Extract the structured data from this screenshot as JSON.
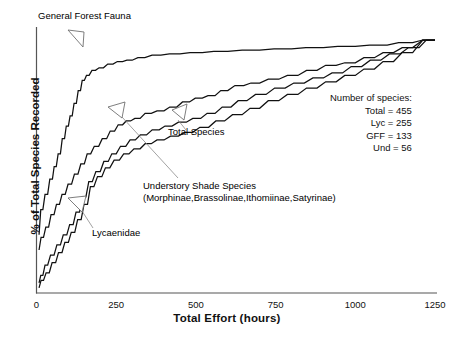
{
  "chart_data": {
    "type": "line",
    "title": "",
    "xlabel": "Total Effort (hours)",
    "ylabel": "% of Total Species Recorded",
    "xlim": [
      0,
      1250
    ],
    "ylim": [
      0,
      100
    ],
    "xticks": [
      "0",
      "250",
      "500",
      "750",
      "1000",
      "1250"
    ],
    "yticks": [],
    "grid": false,
    "legend_position": "none",
    "annotations": [
      "General Forest Fauna",
      "Total Species",
      "Understory Shade Species",
      "(Morphinae,Brassolinae,Ithomiinae,Satyrinae)",
      "Lycaenidae"
    ],
    "series": [
      {
        "name": "General Forest Fauna",
        "x": [
          8,
          20,
          35,
          50,
          62,
          75,
          88,
          100,
          112,
          125,
          138,
          150,
          165,
          185,
          210,
          240,
          270,
          300,
          340,
          390,
          450,
          520,
          600,
          700,
          800,
          900,
          1000,
          1100,
          1180,
          1250
        ],
        "y": [
          23,
          33,
          39,
          45,
          50,
          55,
          61,
          66,
          70,
          75,
          80,
          84,
          86,
          88,
          89,
          90.5,
          91.5,
          92,
          93,
          94,
          94.5,
          95,
          95.5,
          96,
          96.5,
          97,
          97.5,
          98,
          99,
          100
        ]
      },
      {
        "name": "Total Species",
        "x": [
          8,
          22,
          38,
          55,
          72,
          90,
          110,
          130,
          150,
          170,
          195,
          220,
          245,
          270,
          295,
          325,
          360,
          400,
          440,
          480,
          520,
          560,
          600,
          650,
          700,
          760,
          820,
          880,
          940,
          1000,
          1060,
          1120,
          1180,
          1250
        ],
        "y": [
          17,
          22,
          26,
          31,
          35,
          39,
          43,
          47,
          51,
          55,
          58,
          61,
          64,
          66.5,
          68,
          69,
          71,
          72,
          73.5,
          75.5,
          77,
          78,
          80,
          82,
          83,
          84.5,
          86,
          88,
          90,
          91,
          93,
          95,
          97,
          100
        ]
      },
      {
        "name": "Understory Shade Species",
        "x": [
          8,
          20,
          35,
          55,
          75,
          95,
          115,
          135,
          155,
          175,
          200,
          225,
          250,
          280,
          310,
          345,
          385,
          425,
          470,
          515,
          560,
          610,
          660,
          720,
          780,
          840,
          900,
          960,
          1020,
          1080,
          1140,
          1200,
          1250
        ],
        "y": [
          4,
          7,
          11,
          15,
          19,
          23,
          27,
          32,
          38,
          44,
          48,
          52,
          55,
          58,
          60.5,
          62.5,
          64.5,
          66,
          67.5,
          69,
          71,
          73.5,
          76,
          78.5,
          81,
          83,
          85,
          87,
          89.5,
          92,
          94.5,
          97,
          100
        ]
      },
      {
        "name": "Lycaenidae",
        "x": [
          8,
          22,
          40,
          60,
          80,
          100,
          120,
          140,
          160,
          180,
          205,
          230,
          260,
          290,
          325,
          360,
          400,
          445,
          490,
          540,
          590,
          645,
          700,
          760,
          820,
          880,
          940,
          1000,
          1060,
          1120,
          1180,
          1250
        ],
        "y": [
          2,
          5,
          8,
          12,
          16,
          20,
          24,
          29,
          35,
          42,
          46,
          49.5,
          52.5,
          55,
          57,
          59,
          60.5,
          62,
          63.5,
          65.5,
          68,
          70.5,
          73,
          76,
          78.5,
          81,
          83.5,
          86,
          88.5,
          91.5,
          95,
          100
        ]
      }
    ]
  },
  "axes": {
    "xlabel": "Total Effort (hours)",
    "ylabel": "% of Total Species Recorded",
    "xticks": [
      {
        "label": "0",
        "value": 0
      },
      {
        "label": "250",
        "value": 250
      },
      {
        "label": "500",
        "value": 500
      },
      {
        "label": "750",
        "value": 750
      },
      {
        "label": "1000",
        "value": 1000
      },
      {
        "label": "1250",
        "value": 1250
      }
    ]
  },
  "annotations": {
    "gff": "General Forest Fauna",
    "total": "Total Species",
    "understory": "Understory Shade Species",
    "understory_sub": "(Morphinae,Brassolinae,Ithomiinae,Satyrinae)",
    "lycaenidae": "Lycaenidae"
  },
  "legend": {
    "heading": "Number of species:",
    "rows": [
      {
        "label": "Total=",
        "value": "455"
      },
      {
        "label": "Lyc=",
        "value": "255"
      },
      {
        "label": "GFF=",
        "value": "133"
      },
      {
        "label": "Und=",
        "value": "56"
      }
    ],
    "line_total": "Total =  455",
    "line_lyc": "Lyc = 255",
    "line_gff": "GFF = 133",
    "line_und": "Und =  56"
  },
  "colors": {
    "line": "#111111",
    "axis": "#555555",
    "leader": "#777777",
    "background": "#ffffff"
  }
}
